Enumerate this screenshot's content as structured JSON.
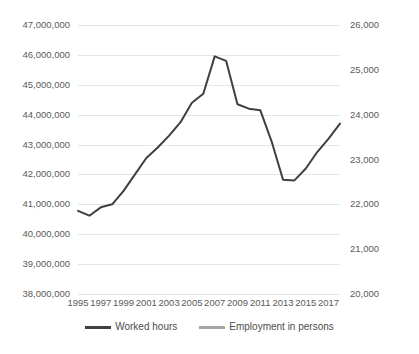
{
  "chart_data": {
    "type": "line",
    "title": "",
    "xlabel": "",
    "ylabel": "",
    "grid": true,
    "legend_position": "bottom",
    "x": [
      1995,
      1996,
      1997,
      1998,
      1999,
      2000,
      2001,
      2002,
      2003,
      2004,
      2005,
      2006,
      2007,
      2008,
      2009,
      2010,
      2011,
      2012,
      2013,
      2014,
      2015,
      2016,
      2017,
      2018
    ],
    "x_tick_labels": [
      "1995",
      "1997",
      "1999",
      "2001",
      "2003",
      "2005",
      "2007",
      "2009",
      "2011",
      "2013",
      "2015",
      "2017"
    ],
    "x_ticks": [
      1995,
      1997,
      1999,
      2001,
      2003,
      2005,
      2007,
      2009,
      2011,
      2013,
      2015,
      2017
    ],
    "axes": [
      {
        "id": "left",
        "side": "left",
        "ylim": [
          38000000,
          47000000
        ],
        "tick_step": 1000000,
        "tick_labels": [
          "47,000,000",
          "46,000,000",
          "45,000,000",
          "44,000,000",
          "43,000,000",
          "42,000,000",
          "41,000,000",
          "40,000,000",
          "39,000,000",
          "38,000,000"
        ],
        "tick_values": [
          47000000,
          46000000,
          45000000,
          44000000,
          43000000,
          42000000,
          41000000,
          40000000,
          39000000,
          38000000
        ]
      },
      {
        "id": "right",
        "side": "right",
        "ylim": [
          20000,
          26000
        ],
        "tick_step": 1000,
        "tick_labels": [
          "26,000",
          "25,000",
          "24,000",
          "23,000",
          "22,000",
          "21,000",
          "20,000"
        ],
        "tick_values": [
          26000,
          25000,
          24000,
          23000,
          22000,
          21000,
          20000
        ]
      }
    ],
    "series": [
      {
        "name": "Worked hours",
        "axis": "left",
        "color": "#404040",
        "values": [
          40780000,
          40620000,
          40900000,
          41000000,
          41450000,
          42000000,
          42550000,
          42900000,
          43300000,
          43750000,
          44400000,
          44700000,
          45950000,
          45800000,
          44350000,
          44200000,
          44150000,
          43100000,
          41820000,
          41800000,
          42200000,
          42750000,
          43200000,
          43700000
        ]
      },
      {
        "name": "Employment in persons",
        "axis": "right",
        "color": "#a6a6a6",
        "values": [
          22550000,
          22480000,
          22720000,
          23000000,
          23450000,
          24000000,
          24450000,
          24700000,
          24950000,
          25100000,
          25400000,
          25550000,
          25950000,
          25900000,
          25300000,
          25230000,
          25320000,
          25280000,
          24800000,
          24780000,
          24900000,
          25120000,
          25500000,
          25800000
        ]
      }
    ],
    "legend": [
      {
        "label": "Worked hours",
        "color": "#404040"
      },
      {
        "label": "Employment in persons",
        "color": "#a6a6a6"
      }
    ],
    "colors": {
      "gridline": "#e6e6e6",
      "axis_text": "#5a5a5a",
      "background": "#ffffff"
    }
  }
}
